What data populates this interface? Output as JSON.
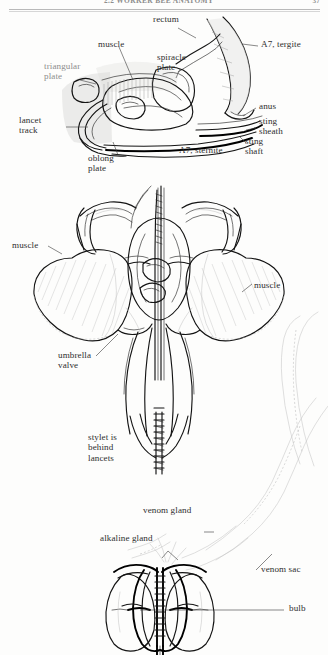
{
  "page": {
    "running_head": "2.2  WORKER BEE ANATOMY",
    "page_number": "37"
  },
  "figures": [
    {
      "id": "lateral-sting-chamber",
      "name": "Lateral view of sting chamber",
      "labels": [
        {
          "key": "rectum",
          "text": "rectum"
        },
        {
          "key": "a7_tergite",
          "text": "A7, tergite"
        },
        {
          "key": "muscle",
          "text": "muscle"
        },
        {
          "key": "spiracle_plate",
          "text": "spiracle\nplate"
        },
        {
          "key": "triangular_plate",
          "text": "triangular\nplate"
        },
        {
          "key": "anus",
          "text": "anus"
        },
        {
          "key": "lancet_track",
          "text": "lancet\ntrack"
        },
        {
          "key": "sting_sheath",
          "text": "sting\nsheath"
        },
        {
          "key": "sting_shaft",
          "text": "sting\nshaft"
        },
        {
          "key": "oblong_plate",
          "text": "oblong\nplate"
        },
        {
          "key": "a7_sternite",
          "text": "A7, sternite"
        }
      ]
    },
    {
      "id": "sting-apparatus-dorsal",
      "name": "Dorsal view of sting apparatus with muscles",
      "labels": [
        {
          "key": "muscle_left",
          "text": "muscle"
        },
        {
          "key": "muscle_right",
          "text": "muscle"
        },
        {
          "key": "umbrella_valve",
          "text": "umbrella\nvalve"
        },
        {
          "key": "stylet_note",
          "text": "stylet is\nbehind\nlancets"
        }
      ]
    },
    {
      "id": "venom-apparatus",
      "name": "Venom gland, sac and bulb",
      "labels": [
        {
          "key": "venom_gland",
          "text": "venom gland"
        },
        {
          "key": "alkaline_gland",
          "text": "alkaline gland"
        },
        {
          "key": "venom_sac",
          "text": "venom sac"
        },
        {
          "key": "bulb",
          "text": "bulb"
        }
      ]
    }
  ],
  "colors": {
    "ink": "#1d1d1d",
    "lead_line": "#3a3a3a",
    "hatch": "#9b9b9b",
    "ghost": "#c4c4c4",
    "paper": "#fdfdfc",
    "faint_text": "#8d8d8d"
  }
}
